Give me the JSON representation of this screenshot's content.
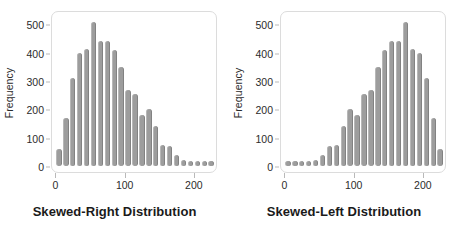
{
  "figure": {
    "panel_count": 2
  },
  "chart_data": [
    {
      "type": "bar",
      "title": "Skewed-Right Distribution",
      "xlabel": "",
      "ylabel": "Frequency",
      "xlim": [
        -5,
        232
      ],
      "ylim": [
        0,
        530
      ],
      "grid": false,
      "legend": null,
      "xticks": [
        0,
        100,
        200
      ],
      "yticks": [
        0,
        100,
        200,
        300,
        400,
        500
      ],
      "bin_width": 10,
      "categories": [
        5,
        15,
        25,
        35,
        45,
        55,
        65,
        75,
        85,
        95,
        105,
        115,
        125,
        135,
        145,
        155,
        165,
        175,
        185,
        195,
        205,
        215,
        225
      ],
      "values": [
        60,
        170,
        310,
        400,
        415,
        510,
        440,
        440,
        410,
        350,
        270,
        255,
        180,
        200,
        140,
        75,
        70,
        40,
        20,
        12,
        10,
        10,
        10
      ]
    },
    {
      "type": "bar",
      "title": "Skewed-Left Distribution",
      "xlabel": "",
      "ylabel": "Frequency",
      "xlim": [
        -5,
        232
      ],
      "ylim": [
        0,
        530
      ],
      "grid": false,
      "legend": null,
      "xticks": [
        0,
        100,
        200
      ],
      "yticks": [
        0,
        100,
        200,
        300,
        400,
        500
      ],
      "bin_width": 10,
      "categories": [
        5,
        15,
        25,
        35,
        45,
        55,
        65,
        75,
        85,
        95,
        105,
        115,
        125,
        135,
        145,
        155,
        165,
        175,
        185,
        195,
        205,
        215,
        225
      ],
      "values": [
        10,
        10,
        10,
        12,
        20,
        40,
        70,
        75,
        140,
        200,
        180,
        255,
        270,
        350,
        410,
        440,
        440,
        510,
        415,
        400,
        310,
        170,
        60
      ]
    }
  ],
  "panels": [
    {
      "caption": "Skewed-Right Distribution",
      "ylabel": "Frequency",
      "ytick_labels": [
        "0",
        "100",
        "200",
        "300",
        "400",
        "500"
      ],
      "xtick_labels": [
        "0",
        "100",
        "200"
      ]
    },
    {
      "caption": "Skewed-Left Distribution",
      "ylabel": "Frequency",
      "ytick_labels": [
        "0",
        "100",
        "200",
        "300",
        "400",
        "500"
      ],
      "xtick_labels": [
        "0",
        "100",
        "200"
      ]
    }
  ],
  "colors": {
    "bar_fill": "#9d9d9d",
    "bar_edge_light": "#b7b7b7",
    "bar_edge_dark": "#828282",
    "frame": "#dcdcdc",
    "text": "#2b2b2b",
    "caption": "#1a1a1a",
    "background": "#ffffff"
  }
}
